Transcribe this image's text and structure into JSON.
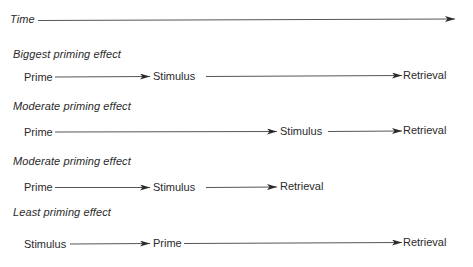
{
  "diagram": {
    "time_axis": {
      "label": "Time"
    },
    "rows": [
      {
        "heading": "Biggest priming effect",
        "nodes": [
          "Prime",
          "Stimulus",
          "Retrieval"
        ]
      },
      {
        "heading": "Moderate priming effect",
        "nodes": [
          "Prime",
          "Stimulus",
          "Retrieval"
        ]
      },
      {
        "heading": "Moderate priming effect",
        "nodes": [
          "Prime",
          "Stimulus",
          "Retrieval"
        ]
      },
      {
        "heading": "Least priming effect",
        "nodes": [
          "Stimulus",
          "Prime",
          "Retrieval"
        ]
      }
    ],
    "colors": {
      "ink": "#2a2a2a",
      "background": "#ffffff"
    }
  }
}
